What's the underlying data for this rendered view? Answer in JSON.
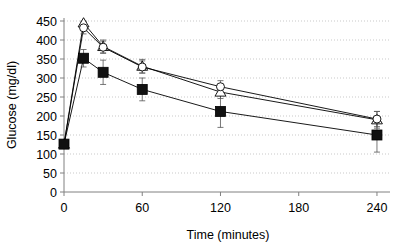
{
  "chart_data": {
    "type": "line",
    "title": "",
    "xlabel": "Time (minutes)",
    "ylabel": "Glucose (mg/dl)",
    "xlim": [
      0,
      250
    ],
    "ylim": [
      0,
      450
    ],
    "grid": true,
    "grid_style": "dotted-horizontal",
    "legend": "none",
    "x_ticks": [
      0,
      60,
      120,
      180,
      240
    ],
    "x_tick_labels": [
      "0",
      "60",
      "120",
      "180",
      "240"
    ],
    "y_ticks": [
      0,
      50,
      100,
      150,
      200,
      250,
      300,
      350,
      400,
      450
    ],
    "y_tick_labels": [
      "0",
      "50",
      "100",
      "150",
      "200",
      "250",
      "300",
      "350",
      "400",
      "450"
    ],
    "x": [
      0,
      15,
      30,
      60,
      120,
      240
    ],
    "series": [
      {
        "name": "open-triangle-series",
        "marker": "triangle-open",
        "color": "#000000",
        "values": [
          126,
          445,
          383,
          331,
          263,
          190
        ],
        "errors": [
          8,
          18,
          17,
          18,
          17,
          22
        ]
      },
      {
        "name": "open-circle-series",
        "marker": "circle-open",
        "color": "#000000",
        "values": [
          126,
          432,
          381,
          329,
          277,
          192
        ],
        "errors": [
          8,
          16,
          16,
          16,
          16,
          20
        ]
      },
      {
        "name": "filled-square-series",
        "marker": "square-filled",
        "color": "#000000",
        "values": [
          126,
          352,
          315,
          270,
          212,
          150
        ],
        "errors": [
          9,
          23,
          32,
          30,
          42,
          45
        ]
      }
    ]
  },
  "axes": {
    "y_axis_title": "Glucose (mg/dl)",
    "x_axis_title": "Time (minutes)"
  }
}
